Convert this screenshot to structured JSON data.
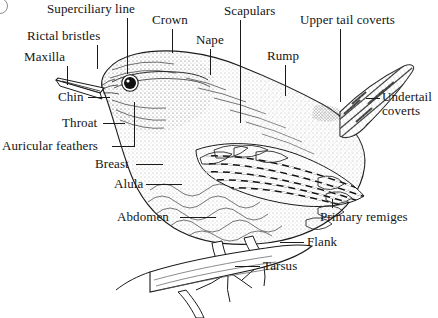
{
  "figure": {
    "background_color": "#ffffff",
    "ink_color": "#1a1a1a",
    "corner_mark": "partial-circle-glyph"
  },
  "labels": [
    {
      "id": "superciliary-line",
      "text": "Superciliary line",
      "x": 47,
      "y": 2,
      "lead": {
        "type": "v",
        "x": 127,
        "y": 18,
        "length": 56
      }
    },
    {
      "id": "crown",
      "text": "Crown",
      "x": 152,
      "y": 13,
      "lead": {
        "type": "v",
        "x": 172,
        "y": 29,
        "length": 24
      }
    },
    {
      "id": "scapulars",
      "text": "Scapulars",
      "x": 224,
      "y": 4,
      "lead": {
        "type": "v",
        "x": 240,
        "y": 20,
        "length": 103
      }
    },
    {
      "id": "upper-tail-coverts",
      "text": "Upper tail coverts",
      "x": 300,
      "y": 13,
      "lead": {
        "type": "v",
        "x": 340,
        "y": 29,
        "length": 73
      }
    },
    {
      "id": "rictal-bristles",
      "text": "Rictal bristles",
      "x": 27,
      "y": 29,
      "lead": {
        "type": "v",
        "x": 97,
        "y": 45,
        "length": 24
      }
    },
    {
      "id": "nape",
      "text": "Nape",
      "x": 196,
      "y": 33,
      "lead": {
        "type": "v",
        "x": 210,
        "y": 49,
        "length": 26
      }
    },
    {
      "id": "rump",
      "text": "Rump",
      "x": 267,
      "y": 49,
      "lead": {
        "type": "v",
        "x": 285,
        "y": 65,
        "length": 31
      }
    },
    {
      "id": "maxilla",
      "text": "Maxilla",
      "x": 24,
      "y": 50,
      "lead": {
        "type": "v",
        "x": 67,
        "y": 66,
        "length": 19
      }
    },
    {
      "id": "undertail-coverts",
      "text": "Undertail coverts",
      "x": 382,
      "y": 90,
      "two_line": true,
      "lead": {
        "type": "h",
        "x": 366,
        "y": 98,
        "length": 14
      }
    },
    {
      "id": "chin",
      "text": "Chin",
      "x": 58,
      "y": 90,
      "lead": {
        "type": "h",
        "x": 88,
        "y": 97,
        "length": 22
      }
    },
    {
      "id": "throat",
      "text": "Throat",
      "x": 62,
      "y": 116,
      "lead": {
        "type": "h",
        "x": 103,
        "y": 123,
        "length": 22
      }
    },
    {
      "id": "auricular-feathers",
      "text": "Auricular feathers",
      "x": 2,
      "y": 139,
      "lead": {
        "type": "h",
        "x": 112,
        "y": 146,
        "length": 22
      }
    },
    {
      "id": "breast",
      "text": "Breast",
      "x": 95,
      "y": 157,
      "lead": {
        "type": "h",
        "x": 136,
        "y": 164,
        "length": 27
      }
    },
    {
      "id": "alula",
      "text": "Alula",
      "x": 114,
      "y": 177,
      "lead": {
        "type": "h",
        "x": 146,
        "y": 184,
        "length": 36
      }
    },
    {
      "id": "abdomen",
      "text": "Abdomen",
      "x": 117,
      "y": 210,
      "lead": {
        "type": "h",
        "x": 180,
        "y": 217,
        "length": 36
      }
    },
    {
      "id": "primary-remiges",
      "text": "Primary remiges",
      "x": 320,
      "y": 210,
      "lead": {
        "type": "v",
        "x": 332,
        "y": 199,
        "length": 9
      }
    },
    {
      "id": "flank",
      "text": "Flank",
      "x": 307,
      "y": 235,
      "lead": {
        "type": "h",
        "x": 280,
        "y": 242,
        "length": 24
      }
    },
    {
      "id": "tarsus",
      "text": "Tarsus",
      "x": 263,
      "y": 259,
      "lead": {
        "type": "h",
        "x": 235,
        "y": 266,
        "length": 25
      }
    }
  ]
}
